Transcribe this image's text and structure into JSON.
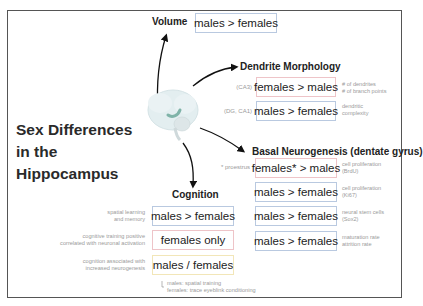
{
  "title": "Sex Differences in the Hippocampus",
  "brain_icon": "brain-hippocampus-icon",
  "colors": {
    "male_box_border": "#b9c9e0",
    "female_box_border": "#eec4c8",
    "mixed_box_border": "#f2e6b8",
    "brain_fill": "#e3eef0",
    "hippocampus_fill": "#7fb3a8"
  },
  "volume": {
    "heading": "Volume",
    "result": "males > females"
  },
  "dendrite_morphology": {
    "heading": "Dendrite Morphology",
    "rows": [
      {
        "region": "(CA3)",
        "result": "females > males",
        "measure_line1": "# of dendrites",
        "measure_line2": "# of branch points"
      },
      {
        "region": "(DG, CA1)",
        "result": "males > females",
        "measure_line1": "dendritic",
        "measure_line2": "complexity"
      }
    ]
  },
  "basal_neurogenesis": {
    "heading": "Basal Neurogenesis (dentate gyrus)",
    "rows": [
      {
        "region": "* proestrus",
        "result": "females* > males",
        "measure_line1": "cell proliferation",
        "measure_line2": "(BrdU)"
      },
      {
        "region": "",
        "result": "males > females",
        "measure_line1": "cell proliferation",
        "measure_line2": "(Ki67)"
      },
      {
        "region": "",
        "result": "males > females",
        "measure_line1": "neural stem cells",
        "measure_line2": "(Sox2)"
      },
      {
        "region": "",
        "result": "males > females",
        "measure_line1": "maturation rate",
        "measure_line2": "attrition rate"
      }
    ]
  },
  "cognition": {
    "heading": "Cognition",
    "rows": [
      {
        "label_line1": "spatial learning",
        "label_line2": "and memory",
        "result": "males > females"
      },
      {
        "label_line1": "cognitive training positive",
        "label_line2": "correlated with neuronal activation",
        "result": "females only"
      },
      {
        "label_line1": "cognition associated with",
        "label_line2": "increased neurogenesis",
        "result": "males / females"
      }
    ],
    "footnote_line1": "males: spatial training",
    "footnote_line2": "females: trace eyeblink conditioning"
  }
}
